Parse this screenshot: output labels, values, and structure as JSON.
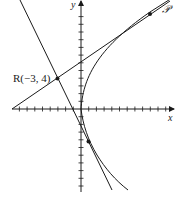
{
  "diagram": {
    "type": "tangent-lines-to-curve",
    "axes": {
      "x_label": "x",
      "y_label": "y",
      "origin_px": [
        81,
        109
      ],
      "tick_spacing_px": 7.7
    },
    "curve": {
      "description": "semicubical parabola with cusp at origin",
      "label": "𝒫"
    },
    "point_R": {
      "label": "R(−3, 4)",
      "coords": [
        -3,
        4
      ]
    },
    "tangent_points": [
      {
        "name": "upper",
        "px": [
          150,
          12
        ]
      },
      {
        "name": "lower",
        "px": [
          88,
          142
        ]
      }
    ],
    "colors": {
      "stroke": "#1a1a1a",
      "background": "#ffffff"
    }
  }
}
